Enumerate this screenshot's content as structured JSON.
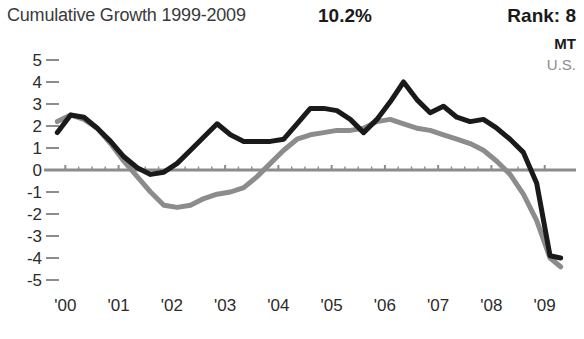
{
  "header": {
    "title": "Cumulative Growth 1999-2009",
    "percent": "10.2%",
    "rank": "Rank: 8"
  },
  "legend": {
    "items": [
      {
        "label": "MT",
        "color": "#1a1a1a"
      },
      {
        "label": "U.S.",
        "color": "#8c8c8c"
      }
    ]
  },
  "chart_data": {
    "type": "line",
    "title": "Cumulative Growth 1999-2009",
    "xlabel": "",
    "ylabel": "",
    "xlim": [
      1999.75,
      2009.4
    ],
    "ylim": [
      -5,
      5
    ],
    "yticks": [
      5,
      4,
      3,
      2,
      1,
      0,
      -1,
      -2,
      -3,
      -4,
      -5
    ],
    "ytick_labels": [
      "5",
      "4",
      "3",
      "2",
      "1",
      "0",
      "-1",
      "-2",
      "-3",
      "-4",
      "-5"
    ],
    "xticks": [
      2000,
      2001,
      2002,
      2003,
      2004,
      2005,
      2006,
      2007,
      2008,
      2009
    ],
    "xtick_labels": [
      "'00",
      "'01",
      "'02",
      "'03",
      "'04",
      "'05",
      "'06",
      "'07",
      "'08",
      "'09"
    ],
    "grid": false,
    "zero_line": true,
    "legend_position": "top-right",
    "series": [
      {
        "name": "MT",
        "color": "#1a1a1a",
        "x": [
          1999.85,
          2000.1,
          2000.35,
          2000.6,
          2000.85,
          2001.1,
          2001.35,
          2001.6,
          2001.85,
          2002.1,
          2002.35,
          2002.6,
          2002.85,
          2003.1,
          2003.35,
          2003.6,
          2003.85,
          2004.1,
          2004.35,
          2004.6,
          2004.85,
          2005.1,
          2005.35,
          2005.6,
          2005.85,
          2006.1,
          2006.35,
          2006.6,
          2006.85,
          2007.1,
          2007.35,
          2007.6,
          2007.85,
          2008.1,
          2008.35,
          2008.6,
          2008.85,
          2009.1,
          2009.3
        ],
        "y": [
          1.7,
          2.5,
          2.4,
          1.9,
          1.3,
          0.6,
          0.1,
          -0.2,
          -0.1,
          0.3,
          0.9,
          1.5,
          2.1,
          1.6,
          1.3,
          1.3,
          1.3,
          1.4,
          2.1,
          2.8,
          2.8,
          2.7,
          2.3,
          1.7,
          2.3,
          3.1,
          4.0,
          3.2,
          2.6,
          2.9,
          2.4,
          2.2,
          2.3,
          1.9,
          1.4,
          0.8,
          -0.6,
          -3.9,
          -4.0
        ]
      },
      {
        "name": "U.S.",
        "color": "#8c8c8c",
        "x": [
          1999.85,
          2000.1,
          2000.35,
          2000.6,
          2000.85,
          2001.1,
          2001.35,
          2001.6,
          2001.85,
          2002.1,
          2002.35,
          2002.6,
          2002.85,
          2003.1,
          2003.35,
          2003.6,
          2003.85,
          2004.1,
          2004.35,
          2004.6,
          2004.85,
          2005.1,
          2005.35,
          2005.6,
          2005.85,
          2006.1,
          2006.35,
          2006.6,
          2006.85,
          2007.1,
          2007.35,
          2007.6,
          2007.85,
          2008.1,
          2008.35,
          2008.6,
          2008.85,
          2009.1,
          2009.3
        ],
        "y": [
          2.2,
          2.5,
          2.3,
          1.9,
          1.2,
          0.4,
          -0.3,
          -1.0,
          -1.6,
          -1.7,
          -1.6,
          -1.3,
          -1.1,
          -1.0,
          -0.8,
          -0.3,
          0.3,
          0.9,
          1.4,
          1.6,
          1.7,
          1.8,
          1.8,
          1.9,
          2.2,
          2.3,
          2.1,
          1.9,
          1.8,
          1.6,
          1.4,
          1.2,
          0.9,
          0.4,
          -0.2,
          -1.1,
          -2.3,
          -4.0,
          -4.4
        ]
      }
    ]
  }
}
